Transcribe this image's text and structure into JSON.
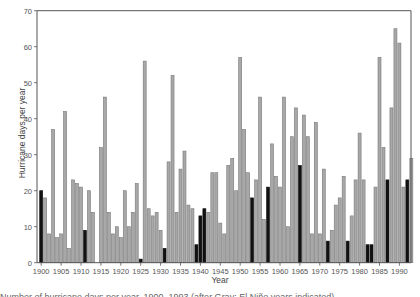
{
  "chart_data": {
    "type": "bar",
    "title": "",
    "xlabel": "Year",
    "ylabel": "Hurricane days per year",
    "ylim": [
      0,
      70
    ],
    "yticks": [
      0,
      10,
      20,
      30,
      40,
      50,
      60,
      70
    ],
    "xticks": [
      1900,
      1905,
      1910,
      1915,
      1920,
      1925,
      1930,
      1935,
      1940,
      1945,
      1950,
      1955,
      1960,
      1965,
      1970,
      1975,
      1980,
      1985,
      1990
    ],
    "grid": false,
    "legend": null,
    "x": [
      1900,
      1901,
      1902,
      1903,
      1904,
      1905,
      1906,
      1907,
      1908,
      1909,
      1910,
      1911,
      1912,
      1913,
      1914,
      1915,
      1916,
      1917,
      1918,
      1919,
      1920,
      1921,
      1922,
      1923,
      1924,
      1925,
      1926,
      1927,
      1928,
      1929,
      1930,
      1931,
      1932,
      1933,
      1934,
      1935,
      1936,
      1937,
      1938,
      1939,
      1940,
      1941,
      1942,
      1943,
      1944,
      1945,
      1946,
      1947,
      1948,
      1949,
      1950,
      1951,
      1952,
      1953,
      1954,
      1955,
      1956,
      1957,
      1958,
      1959,
      1960,
      1961,
      1962,
      1963,
      1964,
      1965,
      1966,
      1967,
      1968,
      1969,
      1970,
      1971,
      1972,
      1973,
      1974,
      1975,
      1976,
      1977,
      1978,
      1979,
      1980,
      1981,
      1982,
      1983,
      1984,
      1985,
      1986,
      1987,
      1988,
      1989,
      1990,
      1991,
      1992,
      1993
    ],
    "values": [
      20,
      18,
      8,
      37,
      7,
      8,
      42,
      4,
      23,
      22,
      21,
      9,
      20,
      14,
      0,
      32,
      46,
      14,
      8,
      10,
      7,
      20,
      10,
      14,
      22,
      1,
      56,
      15,
      13,
      14,
      9,
      4,
      28,
      52,
      14,
      26,
      31,
      16,
      15,
      5,
      13,
      15,
      14,
      25,
      25,
      11,
      8,
      27,
      29,
      20,
      57,
      37,
      25,
      18,
      23,
      46,
      12,
      21,
      33,
      24,
      21,
      46,
      10,
      35,
      43,
      27,
      41,
      35,
      8,
      39,
      8,
      26,
      6,
      9,
      16,
      18,
      24,
      6,
      13,
      23,
      36,
      23,
      5,
      5,
      21,
      57,
      32,
      23,
      43,
      65,
      61,
      21,
      23,
      29
    ],
    "highlighted_years": [
      1900,
      1911,
      1925,
      1931,
      1939,
      1940,
      1941,
      1953,
      1957,
      1965,
      1972,
      1977,
      1982,
      1983,
      1987,
      1992
    ],
    "colors": {
      "normal": "#a8a8a8",
      "normal_edge": "#777777",
      "highlighted": "#111111",
      "axis": "#555555"
    }
  },
  "labels": {
    "ylabel": "Hurricane days per year",
    "xlabel": "Year",
    "caption": "Number of hurricane days per year, 1900–1993 (after Gray; El Niño years indicated)"
  }
}
